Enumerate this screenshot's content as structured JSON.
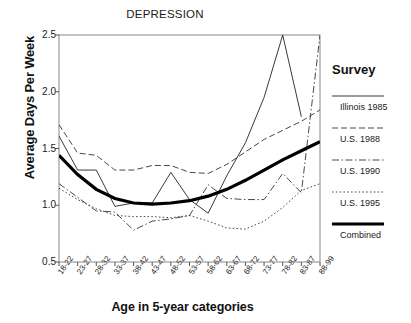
{
  "chart_data": {
    "type": "line",
    "title": "DEPRESSION",
    "xlabel": "Age in 5-year categories",
    "ylabel": "Average Days Per Week",
    "grid": false,
    "legend_position": "right",
    "legend_title": "Survey",
    "ylim": [
      0.5,
      2.5
    ],
    "yticks": [
      "0.5",
      "1.0",
      "1.5",
      "2.0",
      "2.5"
    ],
    "ytick_values": [
      0.5,
      1.0,
      1.5,
      2.0,
      2.5
    ],
    "categories": [
      "18-22",
      "23-27",
      "28-32",
      "33-37",
      "38-42",
      "43-47",
      "48-52",
      "53-57",
      "58-62",
      "63-67",
      "68-72",
      "73-77",
      "78-82",
      "83-87",
      "88-99"
    ],
    "series": [
      {
        "name": "Illinois 1985",
        "style": "solid-thin",
        "values": [
          1.61,
          1.31,
          1.31,
          0.99,
          1.02,
          1.02,
          1.29,
          1.05,
          0.93,
          1.26,
          1.55,
          1.95,
          2.5,
          1.78,
          null
        ]
      },
      {
        "name": "U.S. 1988",
        "style": "dashed",
        "values": [
          1.71,
          1.46,
          1.44,
          1.31,
          1.31,
          1.35,
          1.35,
          1.29,
          1.28,
          1.36,
          1.47,
          1.58,
          1.66,
          1.74,
          1.84
        ]
      },
      {
        "name": "U.S. 1990",
        "style": "dash-dot",
        "values": [
          1.19,
          1.07,
          0.95,
          0.94,
          0.78,
          0.86,
          0.88,
          0.91,
          1.18,
          1.06,
          1.05,
          1.05,
          1.28,
          1.11,
          2.5
        ]
      },
      {
        "name": "U.S. 1995",
        "style": "dotted",
        "values": [
          1.15,
          1.05,
          0.97,
          0.91,
          0.9,
          0.9,
          0.89,
          0.91,
          0.86,
          0.8,
          0.79,
          0.86,
          0.98,
          1.13,
          1.19
        ]
      },
      {
        "name": "Combined",
        "style": "solid-thick",
        "values": [
          1.44,
          1.27,
          1.14,
          1.06,
          1.02,
          1.01,
          1.02,
          1.04,
          1.08,
          1.14,
          1.22,
          1.31,
          1.4,
          1.48,
          1.56
        ]
      }
    ]
  },
  "chart": {
    "title": "DEPRESSION",
    "ylabel": "Average Days Per Week",
    "xlabel": "Age in 5-year categories"
  },
  "legend": {
    "title": "Survey",
    "entries": [
      {
        "label": "Illinois 1985"
      },
      {
        "label": "U.S. 1988"
      },
      {
        "label": "U.S. 1990"
      },
      {
        "label": "U.S. 1995"
      },
      {
        "label": "Combined"
      }
    ]
  }
}
